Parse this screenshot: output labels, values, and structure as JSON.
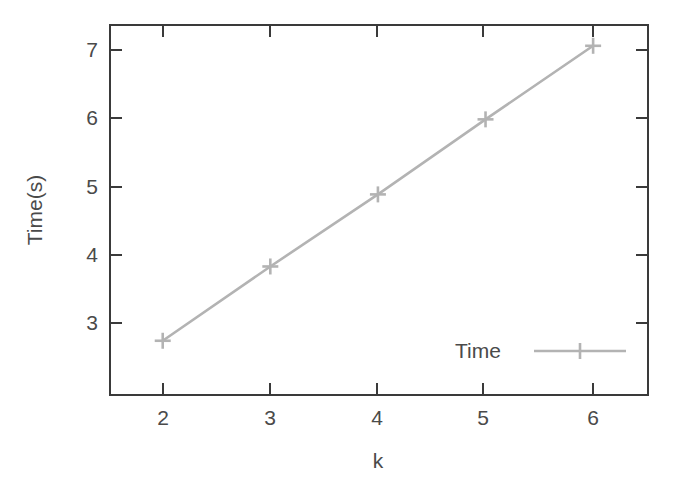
{
  "chart_data": {
    "type": "line",
    "title": "",
    "xlabel": "k",
    "ylabel": "Time(s)",
    "x": [
      2,
      3,
      4,
      5,
      6
    ],
    "series": [
      {
        "name": "Time",
        "values": [
          3.2,
          4.2,
          5.17,
          6.18,
          7.17
        ],
        "color": "#b3b3b3",
        "marker": "plus",
        "line_style": "solid"
      }
    ],
    "xlim": [
      1.51,
      6.51
    ],
    "ylim": [
      2.47,
      7.45
    ],
    "xticks": [
      2,
      3,
      4,
      5,
      6
    ],
    "yticks": [
      3,
      4,
      5,
      6,
      7
    ],
    "xtick_labels": [
      "2",
      "3",
      "4",
      "5",
      "6"
    ],
    "ytick_labels": [
      "3",
      "4",
      "5",
      "6",
      "7"
    ],
    "grid": false,
    "legend_position": "bottom-right",
    "legend_entries": [
      "Time"
    ],
    "frame": "box",
    "background_color": "#ffffff",
    "axis_color": "#3a3a3a",
    "text_color": "#4a4a4a"
  },
  "axes": {
    "x_title": "k",
    "y_title": "Time(s)"
  },
  "legend": {
    "items": [
      {
        "label": "Time"
      }
    ]
  },
  "ticks": {
    "x": [
      {
        "label": "2"
      },
      {
        "label": "3"
      },
      {
        "label": "4"
      },
      {
        "label": "5"
      },
      {
        "label": "6"
      }
    ],
    "y": [
      {
        "label": "3"
      },
      {
        "label": "4"
      },
      {
        "label": "5"
      },
      {
        "label": "6"
      },
      {
        "label": "7"
      }
    ]
  }
}
